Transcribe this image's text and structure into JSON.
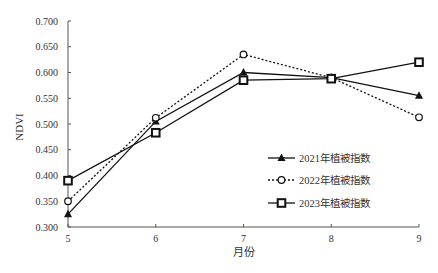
{
  "chart_data": {
    "type": "line",
    "title": "",
    "xlabel": "月份",
    "ylabel": "NDVI",
    "categories": [
      "5",
      "6",
      "7",
      "8",
      "9"
    ],
    "x": [
      5,
      6,
      7,
      8,
      9
    ],
    "ylim": [
      0.3,
      0.7
    ],
    "yticks": [
      "0.300",
      "0.350",
      "0.400",
      "0.450",
      "0.500",
      "0.550",
      "0.600",
      "0.650",
      "0.700"
    ],
    "grid": false,
    "legend_position": "lower right (inside plot)",
    "series": [
      {
        "name": "2021年植被指数",
        "marker": "triangle",
        "line": "solid",
        "values": [
          0.325,
          0.505,
          0.6,
          0.59,
          0.555
        ]
      },
      {
        "name": "2022年植被指数",
        "marker": "circle-open",
        "line": "dotted",
        "values": [
          0.35,
          0.512,
          0.635,
          0.59,
          0.513
        ]
      },
      {
        "name": "2023年植被指数",
        "marker": "square-open",
        "line": "solid",
        "values": [
          0.39,
          0.483,
          0.585,
          0.588,
          0.62
        ]
      }
    ]
  },
  "colors": {
    "line": "#111111",
    "axis": "#555555",
    "text": "#333333"
  }
}
